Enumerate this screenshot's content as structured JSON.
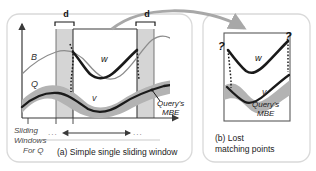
{
  "figure": {
    "panel_a": {
      "caption": "(a) Simple single sliding window",
      "sliding_label_line1": "Sliding",
      "sliding_label_line2": "Windows",
      "sliding_label_line3": "For Q",
      "band_label_left": "d",
      "band_label_right": "d",
      "curve_upper_label": "w",
      "curve_lower_label": "v",
      "baseline_label": "B",
      "query_label": "Q",
      "mbe_label_line1": "Query's",
      "mbe_label_line2": "MBE",
      "ellipsis_left": "...",
      "ellipsis_right": "..."
    },
    "panel_b": {
      "caption_line1": "(b) Lost",
      "caption_line2": "matching points",
      "curve_upper_label": "w",
      "curve_lower_label": "v",
      "question_left": "?",
      "question_right": "?",
      "mbe_label_line1": "Query's",
      "mbe_label_line2": "MBE"
    },
    "colors": {
      "ink": "#1a1a1a",
      "thin_curve": "#8c8c8c",
      "mbe_band": "#b3b3b3",
      "mbe_band_dark": "#9a9a9a",
      "window_band": "#d5d5d5",
      "panel_border": "#d9d9d9",
      "arrow": "#a8a8a8",
      "axis": "#3a3a3a"
    }
  }
}
